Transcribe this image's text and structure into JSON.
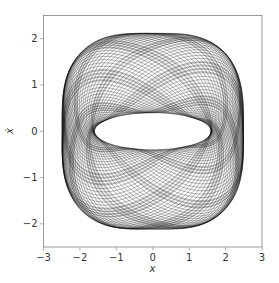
{
  "chart_data": {
    "type": "line",
    "title": "",
    "xlabel": "x",
    "ylabel": "ẋ",
    "xlim": [
      -3,
      3
    ],
    "ylim": [
      -2.5,
      2.5
    ],
    "xticks": [
      -3,
      -2,
      -1,
      0,
      1,
      2,
      3
    ],
    "xtick_labels": [
      "−3",
      "−2",
      "−1",
      "0",
      "1",
      "2",
      "3"
    ],
    "yticks": [
      -2,
      -1,
      0,
      1,
      2
    ],
    "ytick_labels": [
      "−2",
      "−1",
      "0",
      "1",
      "2"
    ],
    "grid": false,
    "legend": null,
    "series": [
      {
        "name": "phase-space trajectory",
        "color": "#000000",
        "description": "Dense quasi-periodic trajectory filling an annular region (phase portrait)",
        "outer_boundary": {
          "x_extent": [
            -2.65,
            2.65
          ],
          "y_extent": [
            -2.25,
            2.25
          ]
        },
        "inner_hole": {
          "x_extent": [
            -1.6,
            1.6
          ],
          "y_extent": [
            -0.4,
            0.4
          ]
        }
      }
    ]
  },
  "colors": {
    "line": "#000000",
    "axes": "#9a9a9a",
    "text": "#333333",
    "background": "#ffffff"
  }
}
